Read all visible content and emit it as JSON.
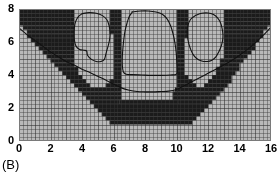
{
  "panel": {
    "label": "(B)"
  },
  "chart_data": {
    "type": "heatmap",
    "title": "",
    "xlabel": "",
    "ylabel": "",
    "xlim": [
      0,
      16
    ],
    "ylim": [
      0,
      8
    ],
    "xticks": [
      0,
      2,
      4,
      6,
      8,
      10,
      12,
      14,
      16
    ],
    "yticks": [
      0,
      2,
      4,
      6,
      8
    ],
    "xtick_labels": [
      "0",
      "2",
      "4",
      "6",
      "8",
      "10",
      "12",
      "14",
      "16"
    ],
    "ytick_labels": [
      "0",
      "2",
      "4",
      "6",
      "8"
    ],
    "grid": true,
    "grid_cell_size": [
      0.25,
      0.25
    ],
    "grid_cols": 64,
    "grid_rows": 32,
    "legend": "none",
    "colors": {
      "background_cell": "#b9b9b9",
      "anomaly_cell": "#1b1b1b",
      "grid_line": "#8d8d8d",
      "contour_line": "#111111",
      "axis_text": "#000000",
      "frame": "#7a7a7a",
      "page_background": "#ffffff"
    },
    "cells": {
      "note": "One entry per grid row, from top (y=8) down to bottom (y=0). Each value is a list of [x_start, x_end] spans in data units that are DARK (anomaly).",
      "row_top_y": 8.0,
      "row_height": 0.25,
      "dark_spans": [
        [
          [
            0.0,
            3.5
          ],
          [
            5.75,
            6.5
          ],
          [
            10.0,
            10.75
          ],
          [
            13.0,
            16.0
          ]
        ],
        [
          [
            0.0,
            3.5
          ],
          [
            5.75,
            6.5
          ],
          [
            10.0,
            10.75
          ],
          [
            13.0,
            16.0
          ]
        ],
        [
          [
            0.0,
            3.5
          ],
          [
            5.75,
            6.5
          ],
          [
            10.0,
            10.75
          ],
          [
            13.0,
            16.0
          ]
        ],
        [
          [
            0.0,
            3.5
          ],
          [
            5.75,
            6.5
          ],
          [
            10.0,
            10.75
          ],
          [
            13.0,
            16.0
          ]
        ],
        [
          [
            0.25,
            3.5
          ],
          [
            5.75,
            6.5
          ],
          [
            10.0,
            10.75
          ],
          [
            13.0,
            15.75
          ]
        ],
        [
          [
            0.5,
            3.5
          ],
          [
            5.75,
            6.5
          ],
          [
            10.0,
            10.75
          ],
          [
            13.0,
            15.5
          ]
        ],
        [
          [
            0.5,
            3.5
          ],
          [
            6.0,
            6.5
          ],
          [
            10.0,
            10.75
          ],
          [
            13.0,
            15.5
          ]
        ],
        [
          [
            0.75,
            3.5
          ],
          [
            6.0,
            6.5
          ],
          [
            10.0,
            10.5
          ],
          [
            13.0,
            15.25
          ]
        ],
        [
          [
            1.0,
            3.5
          ],
          [
            6.0,
            6.5
          ],
          [
            10.0,
            10.5
          ],
          [
            13.0,
            15.0
          ]
        ],
        [
          [
            1.25,
            3.5
          ],
          [
            6.0,
            6.5
          ],
          [
            10.0,
            10.5
          ],
          [
            13.0,
            15.0
          ]
        ],
        [
          [
            1.5,
            3.5
          ],
          [
            6.0,
            6.5
          ],
          [
            10.0,
            10.5
          ],
          [
            13.0,
            14.75
          ]
        ],
        [
          [
            1.75,
            3.5
          ],
          [
            6.0,
            6.5
          ],
          [
            10.0,
            10.5
          ],
          [
            13.0,
            14.5
          ]
        ],
        [
          [
            2.0,
            3.5
          ],
          [
            6.0,
            6.5
          ],
          [
            10.0,
            10.5
          ],
          [
            12.75,
            14.25
          ]
        ],
        [
          [
            2.25,
            3.5
          ],
          [
            6.0,
            6.5
          ],
          [
            10.0,
            10.5
          ],
          [
            12.75,
            14.0
          ]
        ],
        [
          [
            2.5,
            3.75
          ],
          [
            6.0,
            6.5
          ],
          [
            10.0,
            10.5
          ],
          [
            12.5,
            14.0
          ]
        ],
        [
          [
            2.75,
            3.75
          ],
          [
            6.0,
            6.5
          ],
          [
            10.0,
            10.5
          ],
          [
            12.5,
            13.75
          ]
        ],
        [
          [
            3.0,
            4.0
          ],
          [
            6.0,
            6.5
          ],
          [
            10.0,
            10.75
          ],
          [
            12.25,
            13.5
          ]
        ],
        [
          [
            3.25,
            4.25
          ],
          [
            5.75,
            6.5
          ],
          [
            10.0,
            11.0
          ],
          [
            12.0,
            13.5
          ]
        ],
        [
          [
            3.5,
            4.5
          ],
          [
            5.5,
            6.5
          ],
          [
            10.0,
            11.25
          ],
          [
            11.75,
            13.25
          ]
        ],
        [
          [
            3.75,
            6.5
          ],
          [
            9.9,
            13.0
          ]
        ],
        [
          [
            4.0,
            6.5
          ],
          [
            9.75,
            12.75
          ]
        ],
        [
          [
            4.25,
            6.5
          ],
          [
            9.75,
            12.5
          ]
        ],
        [
          [
            4.5,
            6.4
          ],
          [
            6.4,
            10.1
          ],
          [
            10.1,
            12.25
          ]
        ],
        [
          [
            4.75,
            12.0
          ]
        ],
        [
          [
            5.0,
            11.75
          ]
        ],
        [
          [
            5.25,
            11.5
          ]
        ],
        [
          [
            5.5,
            11.25
          ]
        ],
        [
          [
            5.75,
            11.0
          ]
        ],
        [],
        [],
        [],
        []
      ]
    },
    "interface_curve": {
      "name": "basin-interface",
      "points": [
        [
          0.0,
          6.85
        ],
        [
          0.5,
          6.45
        ],
        [
          1.0,
          6.1
        ],
        [
          1.5,
          5.75
        ],
        [
          2.0,
          5.4
        ],
        [
          2.5,
          5.1
        ],
        [
          3.0,
          4.82
        ],
        [
          3.5,
          4.6
        ],
        [
          4.0,
          4.35
        ],
        [
          4.5,
          4.15
        ],
        [
          5.0,
          3.92
        ],
        [
          5.5,
          3.7
        ],
        [
          6.0,
          3.45
        ],
        [
          6.5,
          3.22
        ],
        [
          7.0,
          3.08
        ],
        [
          7.5,
          3.0
        ],
        [
          8.0,
          2.98
        ],
        [
          8.5,
          2.98
        ],
        [
          9.0,
          3.0
        ],
        [
          9.5,
          3.02
        ],
        [
          10.0,
          3.12
        ],
        [
          10.5,
          3.35
        ],
        [
          11.0,
          3.6
        ],
        [
          11.5,
          3.85
        ],
        [
          12.0,
          4.1
        ],
        [
          12.5,
          4.35
        ],
        [
          13.0,
          4.6
        ],
        [
          13.5,
          4.88
        ],
        [
          14.0,
          5.2
        ],
        [
          14.5,
          5.55
        ],
        [
          15.0,
          5.95
        ],
        [
          15.5,
          6.4
        ],
        [
          16.0,
          6.9
        ]
      ]
    },
    "bodies": [
      {
        "name": "left-body",
        "outline": [
          [
            4.02,
            7.72
          ],
          [
            4.45,
            7.78
          ],
          [
            4.9,
            7.74
          ],
          [
            5.3,
            7.6
          ],
          [
            5.58,
            7.35
          ],
          [
            5.72,
            7.0
          ],
          [
            5.78,
            6.6
          ],
          [
            5.76,
            6.2
          ],
          [
            5.68,
            5.82
          ],
          [
            5.58,
            5.5
          ],
          [
            5.5,
            5.2
          ],
          [
            5.42,
            4.95
          ],
          [
            5.2,
            4.82
          ],
          [
            4.9,
            4.82
          ],
          [
            4.6,
            4.95
          ],
          [
            4.35,
            5.2
          ],
          [
            4.3,
            5.45
          ],
          [
            4.12,
            5.5
          ],
          [
            3.85,
            5.55
          ],
          [
            3.62,
            5.75
          ],
          [
            3.52,
            6.1
          ],
          [
            3.5,
            6.5
          ],
          [
            3.52,
            6.9
          ],
          [
            3.6,
            7.25
          ],
          [
            3.78,
            7.55
          ],
          [
            4.02,
            7.72
          ]
        ]
      },
      {
        "name": "center-body",
        "outline": [
          [
            7.2,
            7.82
          ],
          [
            7.7,
            7.88
          ],
          [
            8.2,
            7.88
          ],
          [
            8.7,
            7.82
          ],
          [
            9.1,
            7.68
          ],
          [
            9.4,
            7.4
          ],
          [
            9.62,
            7.0
          ],
          [
            9.78,
            6.5
          ],
          [
            9.9,
            5.95
          ],
          [
            9.98,
            5.35
          ],
          [
            10.02,
            4.8
          ],
          [
            10.04,
            4.35
          ],
          [
            10.0,
            4.05
          ],
          [
            9.6,
            4.0
          ],
          [
            9.0,
            3.98
          ],
          [
            8.4,
            3.98
          ],
          [
            7.8,
            4.0
          ],
          [
            7.2,
            4.02
          ],
          [
            6.8,
            4.05
          ],
          [
            6.62,
            4.2
          ],
          [
            6.56,
            4.6
          ],
          [
            6.56,
            5.1
          ],
          [
            6.6,
            5.65
          ],
          [
            6.66,
            6.2
          ],
          [
            6.74,
            6.7
          ],
          [
            6.86,
            7.15
          ],
          [
            7.0,
            7.55
          ],
          [
            7.2,
            7.82
          ]
        ]
      },
      {
        "name": "right-body",
        "outline": [
          [
            11.2,
            7.6
          ],
          [
            11.6,
            7.74
          ],
          [
            12.0,
            7.76
          ],
          [
            12.35,
            7.66
          ],
          [
            12.62,
            7.45
          ],
          [
            12.8,
            7.15
          ],
          [
            12.9,
            6.8
          ],
          [
            12.95,
            6.42
          ],
          [
            12.92,
            6.05
          ],
          [
            12.82,
            5.7
          ],
          [
            12.68,
            5.4
          ],
          [
            12.5,
            5.1
          ],
          [
            12.25,
            4.9
          ],
          [
            11.95,
            4.82
          ],
          [
            11.6,
            4.85
          ],
          [
            11.28,
            5.0
          ],
          [
            11.05,
            5.25
          ],
          [
            10.9,
            5.55
          ],
          [
            10.78,
            5.9
          ],
          [
            10.7,
            6.3
          ],
          [
            10.68,
            6.7
          ],
          [
            10.74,
            7.05
          ],
          [
            10.9,
            7.38
          ],
          [
            11.2,
            7.6
          ]
        ]
      }
    ]
  }
}
